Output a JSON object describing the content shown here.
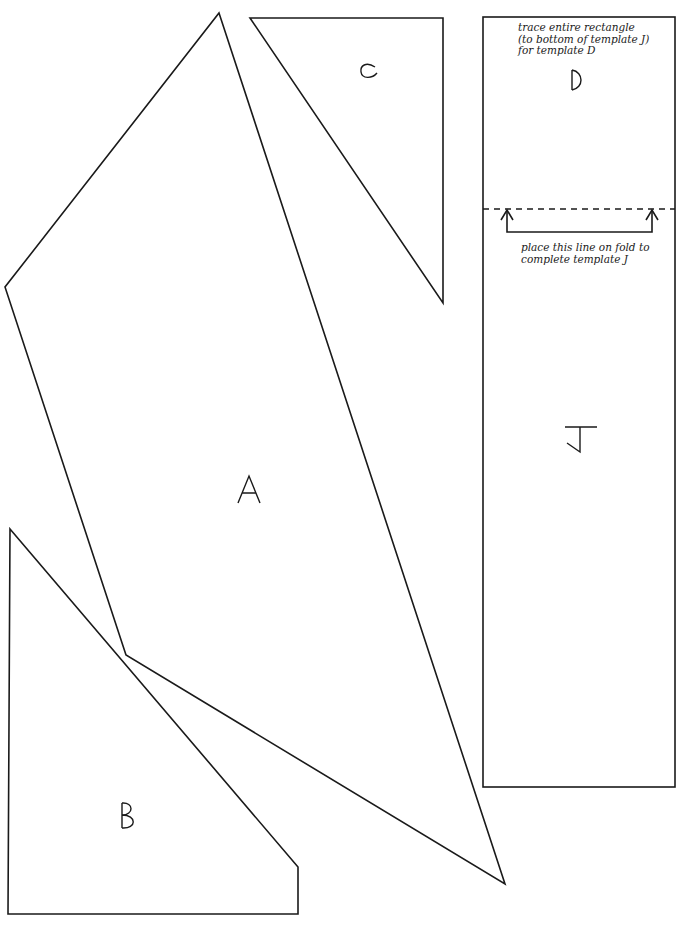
{
  "templates": {
    "A": {
      "label": "A"
    },
    "B": {
      "label": "B"
    },
    "C": {
      "label": "C"
    },
    "D": {
      "label": "D"
    },
    "J": {
      "label": "J"
    }
  },
  "notes": {
    "trace_line1": "trace entire rectangle",
    "trace_line2": "(to bottom of template J)",
    "trace_line3": "for template D",
    "fold_line1": "place this line on fold to",
    "fold_line2": "complete template J"
  }
}
